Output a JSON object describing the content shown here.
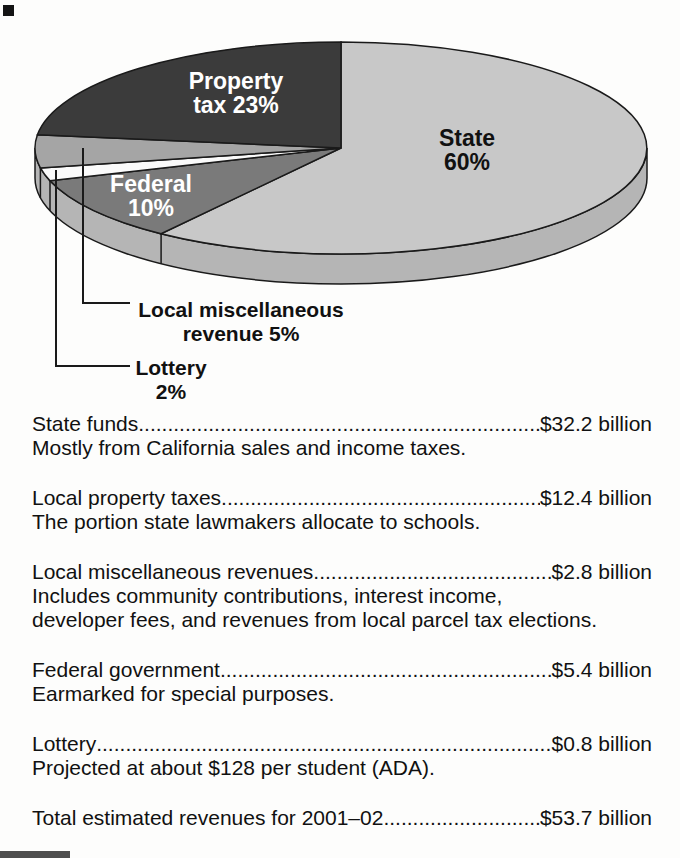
{
  "chart_data": {
    "type": "pie",
    "style": "3d",
    "title": "",
    "legend_position": "none",
    "outline_color": "#1a1a1a",
    "rim_color": "#b5b5b5",
    "slices": [
      {
        "id": "state",
        "label": "State",
        "pct": 60,
        "color": "#c8c8c8",
        "text_color": "#111111",
        "label_lines": [
          "State",
          "60%"
        ],
        "label_pos": [
          467,
          146
        ]
      },
      {
        "id": "federal",
        "label": "Federal",
        "pct": 10,
        "color": "#7a7a7a",
        "text_color": "#ffffff",
        "label_lines": [
          "Federal",
          "10%"
        ],
        "label_pos": [
          151,
          192
        ]
      },
      {
        "id": "lottery",
        "label": "Lottery",
        "pct": 2,
        "color": "#fafafa",
        "callout": {
          "lines": [
            "Lottery",
            "2%"
          ],
          "line": [
            [
              56,
              170
            ],
            [
              56,
              366
            ],
            [
              130,
              366
            ]
          ],
          "text_pos": [
            171,
            375
          ]
        }
      },
      {
        "id": "local-miscellaneous",
        "label": "Local miscellaneous revenue",
        "pct": 5,
        "color": "#a5a5a5",
        "callout": {
          "lines": [
            "Local miscellaneous",
            "revenue 5%"
          ],
          "line": [
            [
              83,
              148
            ],
            [
              83,
              303
            ],
            [
              130,
              303
            ]
          ],
          "text_pos": [
            241,
            317
          ]
        }
      },
      {
        "id": "property-tax",
        "label": "Property tax",
        "pct": 23,
        "color": "#3b3b3b",
        "text_color": "#ffffff",
        "label_lines": [
          "Property",
          "tax 23%"
        ],
        "label_pos": [
          236,
          89
        ]
      }
    ]
  },
  "funding_list": {
    "items": [
      {
        "title": "State funds",
        "amount": "$32.2 billion",
        "desc": [
          "Mostly from California sales and income taxes."
        ]
      },
      {
        "title": "Local property taxes",
        "amount": "$12.4 billion",
        "desc": [
          "The portion state lawmakers allocate to schools."
        ]
      },
      {
        "title": "Local miscellaneous revenues",
        "amount": "$2.8 billion",
        "desc": [
          "Includes community contributions, interest income,",
          "developer fees, and revenues from local parcel tax elections."
        ]
      },
      {
        "title": "Federal government",
        "amount": "$5.4 billion",
        "desc": [
          "Earmarked for special purposes."
        ]
      },
      {
        "title": "Lottery",
        "amount": "$0.8 billion",
        "desc": [
          "Projected at about $128 per student (ADA)."
        ]
      },
      {
        "title": "Total estimated revenues for 2001–02",
        "amount": "$53.7 billion",
        "desc": []
      }
    ]
  }
}
